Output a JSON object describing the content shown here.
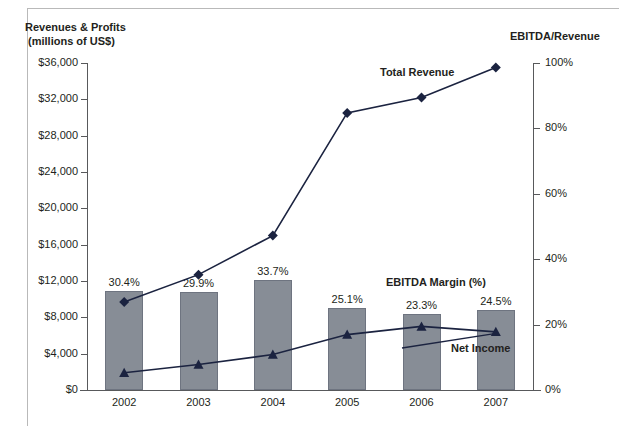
{
  "chart_data": {
    "type": "bar",
    "title": "",
    "subtitle": "",
    "categories": [
      "2002",
      "2003",
      "2004",
      "2005",
      "2006",
      "2007"
    ],
    "xlabel": "",
    "ylabel": "Revenues & Profits\n (millions of US$)",
    "y2label": "EBITDA/Revenue",
    "ylim": [
      0,
      36000
    ],
    "y2lim": [
      0,
      100
    ],
    "grid": false,
    "legend_position": "inline-annotations",
    "y_ticks": [
      "$0",
      "$4,000",
      "$8,000",
      "$12,000",
      "$16,000",
      "$20,000",
      "$24,000",
      "$28,000",
      "$32,000",
      "$36,000"
    ],
    "y_tick_values": [
      0,
      4000,
      8000,
      12000,
      16000,
      20000,
      24000,
      28000,
      32000,
      36000
    ],
    "y2_ticks": [
      "0%",
      "20%",
      "40%",
      "60%",
      "80%",
      "100%"
    ],
    "y2_tick_values": [
      0,
      20,
      40,
      60,
      80,
      100
    ],
    "series": [
      {
        "name": "EBITDA Margin (%)",
        "type": "bar",
        "axis": "right",
        "unit": "%",
        "values": [
          30.4,
          29.9,
          33.7,
          25.1,
          23.3,
          24.5
        ],
        "data_labels": [
          "30.4%",
          "29.9%",
          "33.7%",
          "25.1%",
          "23.3%",
          "24.5%"
        ],
        "color": "#878d96"
      },
      {
        "name": "Total Revenue",
        "type": "line",
        "axis": "left",
        "marker": "diamond",
        "unit": "millions of US$",
        "values": [
          9700,
          12700,
          17000,
          30500,
          32200,
          35500
        ],
        "color": "#1b2340"
      },
      {
        "name": "Net Income",
        "type": "line",
        "axis": "left",
        "marker": "triangle",
        "unit": "millions of US$",
        "values": [
          1900,
          2800,
          3900,
          6100,
          7000,
          6400
        ],
        "color": "#1b2340"
      }
    ],
    "annotations": [
      {
        "text": "Total Revenue",
        "for": "Total Revenue"
      },
      {
        "text": "Net Income",
        "for": "Net Income"
      },
      {
        "text": "EBITDA Margin (%)",
        "for": "EBITDA Margin (%)"
      }
    ]
  },
  "axes": {
    "left_title_line1": "Revenues & Profits",
    "left_title_line2": " (millions of US$)",
    "right_title": "EBITDA/Revenue"
  },
  "annotations": {
    "total_revenue": "Total Revenue",
    "net_income": "Net Income",
    "ebitda_margin": "EBITDA Margin (%)"
  }
}
